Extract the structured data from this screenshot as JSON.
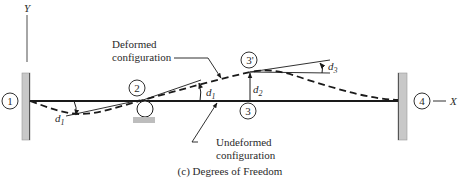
{
  "figure": {
    "caption": "(c) Degrees of Freedom",
    "axes": {
      "y_label": "Y",
      "x_label": "X"
    },
    "nodes": [
      {
        "id": "1",
        "label": "1"
      },
      {
        "id": "2",
        "label": "2"
      },
      {
        "id": "3",
        "label": "3"
      },
      {
        "id": "3p",
        "label": "3'"
      },
      {
        "id": "4",
        "label": "4"
      }
    ],
    "dofs": {
      "d1_left": {
        "sym": "d",
        "sub": "1"
      },
      "d1_mid": {
        "sym": "d",
        "sub": "1"
      },
      "d2": {
        "sym": "d",
        "sub": "2"
      },
      "d3": {
        "sym": "d",
        "sub": "3"
      }
    },
    "annotations": {
      "deformed_line1": "Deformed",
      "deformed_line2": "configuration",
      "undeformed_line1": "Undeformed",
      "undeformed_line2": "configuration"
    },
    "supports": {
      "left": "fixed-wall",
      "node2": "roller",
      "right": "fixed-wall"
    },
    "colors": {
      "line": "#1a1a1a",
      "wall_fill": "#c8c8c8",
      "text": "#2a2a2a"
    }
  }
}
